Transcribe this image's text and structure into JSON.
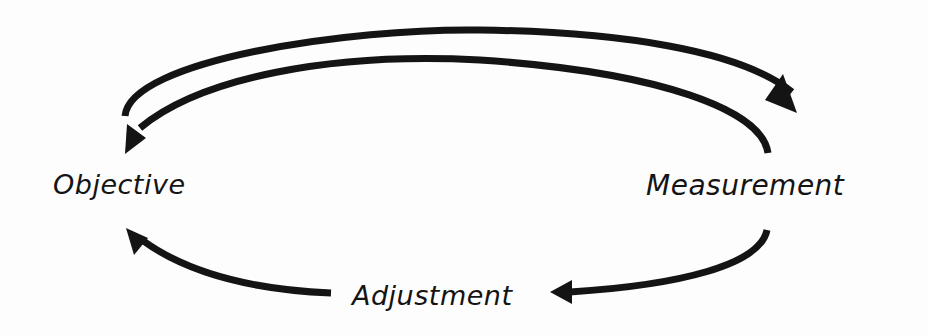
{
  "diagram": {
    "type": "feedback-cycle",
    "nodes": [
      {
        "id": "objective",
        "label": "Objective"
      },
      {
        "id": "measurement",
        "label": "Measurement"
      },
      {
        "id": "adjustment",
        "label": "Adjustment"
      }
    ],
    "edges": [
      {
        "from": "objective",
        "to": "measurement",
        "style": "curved-arrow-top-outer"
      },
      {
        "from": "measurement",
        "to": "objective",
        "style": "curved-arrow-top-inner"
      },
      {
        "from": "measurement",
        "to": "adjustment",
        "style": "curved-arrow-bottom-right"
      },
      {
        "from": "adjustment",
        "to": "objective",
        "style": "curved-arrow-bottom-left"
      }
    ],
    "colors": {
      "stroke": "#141414",
      "text": "#141414",
      "background": "#fdfdfd"
    }
  }
}
